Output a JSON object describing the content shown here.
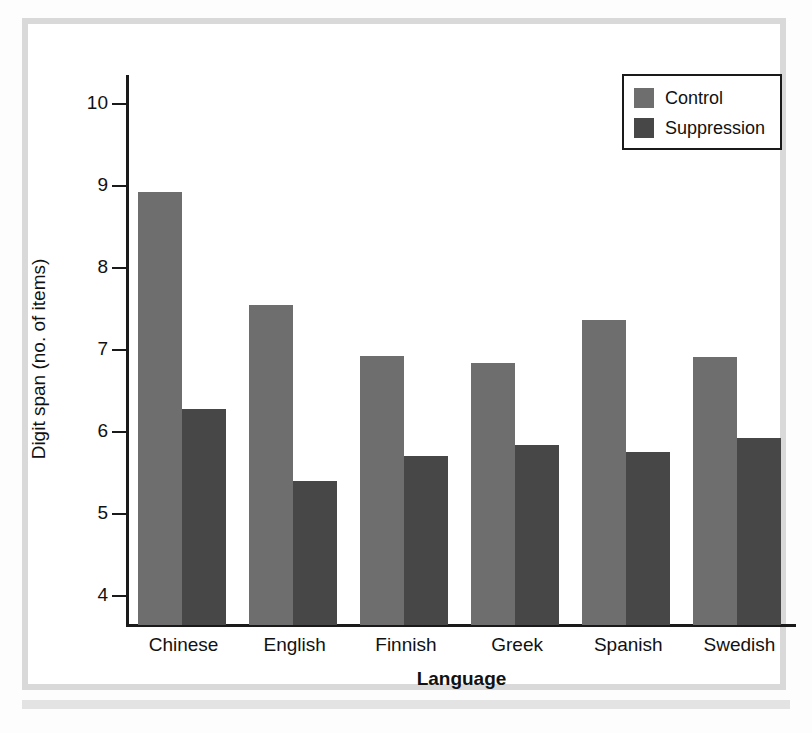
{
  "chart_data": {
    "type": "bar",
    "title": "",
    "xlabel": "Language",
    "ylabel": "Digit span (no. of items)",
    "categories": [
      "Chinese",
      "English",
      "Finnish",
      "Greek",
      "Spanish",
      "Swedish"
    ],
    "series": [
      {
        "name": "Control",
        "color": "#6e6e6e",
        "values": [
          8.92,
          7.55,
          6.93,
          6.84,
          7.36,
          6.92
        ]
      },
      {
        "name": "Suppression",
        "color": "#474747",
        "values": [
          6.28,
          5.41,
          5.71,
          5.84,
          5.76,
          5.93
        ]
      }
    ],
    "ylim": [
      3.65,
      10.35
    ],
    "yticks": [
      10,
      9,
      8,
      7,
      6,
      5,
      4
    ],
    "ytick_labels": [
      "10",
      "9",
      "8",
      "7",
      "6",
      "5",
      "4"
    ],
    "grid": false,
    "legend_position": "top-right"
  },
  "legend": {
    "items": [
      {
        "label": "Control"
      },
      {
        "label": "Suppression"
      }
    ]
  },
  "axes": {
    "y_title": "Digit span (no. of items)",
    "x_title": "Language"
  },
  "colors": {
    "control": "#6e6e6e",
    "suppression": "#474747",
    "axis": "#1a1a1a",
    "page_border": "#d9d9d9",
    "background": "#ffffff"
  }
}
